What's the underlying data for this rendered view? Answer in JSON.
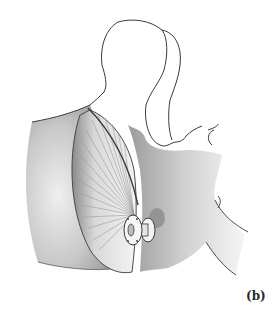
{
  "figure": {
    "panel_label": "(b)",
    "colors": {
      "line": "#3a3a3a",
      "shade_dark": "#6e6e6e",
      "shade_mid": "#a8a8a8",
      "shade_light": "#d6d6d6",
      "background": "#ffffff"
    }
  }
}
